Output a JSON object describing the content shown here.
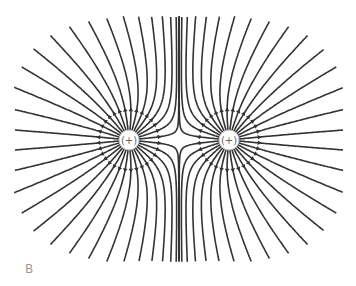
{
  "diagram": {
    "panel_label": "B",
    "line_color": "#333333",
    "charges": [
      {
        "id": "left",
        "label": "(+)",
        "x": 129,
        "y": 140,
        "q": 1
      },
      {
        "id": "right",
        "label": "(+)",
        "x": 229,
        "y": 140,
        "q": 1
      }
    ],
    "lines_per_charge": 32,
    "arrow_direction": "outward",
    "arrow_ring_radius": 30,
    "charge_radius": 10,
    "bounds": {
      "xmin": 14,
      "xmax": 343,
      "ymin": 16,
      "ymax": 262
    }
  }
}
